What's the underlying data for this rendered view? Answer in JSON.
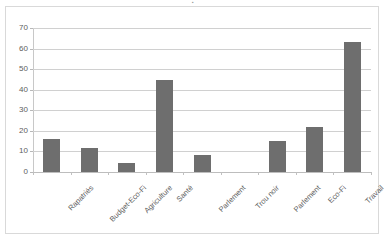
{
  "chart_data": {
    "type": "bar",
    "title": "",
    "subtitle": "",
    "xlabel": "",
    "ylabel": "",
    "categories": [
      "Rapatriés",
      "Budget-Eco-Fi",
      "Agriculture",
      "Santé",
      "Parlement",
      "Trou noir",
      "Parlement",
      "Eco-Fi",
      "Travail"
    ],
    "values": [
      16,
      11.5,
      4.5,
      44.5,
      8.5,
      0,
      15.3,
      22,
      63
    ],
    "ylim": [
      0,
      70
    ],
    "ytick_values": [
      0,
      10,
      20,
      30,
      40,
      50,
      60,
      70
    ],
    "ytick_labels": [
      "0",
      "10",
      "20",
      "30",
      "40",
      "50",
      "60",
      "70"
    ],
    "grid": true,
    "legend": false,
    "legend_position": "none",
    "series": [
      {
        "name": "",
        "values": [
          16,
          11.5,
          4.5,
          44.5,
          8.5,
          0,
          15.3,
          22,
          63
        ],
        "color": "#6E6E6E"
      }
    ]
  },
  "style": {
    "bar_color": "#6E6E6E",
    "gridline_color": "#D0D0D0",
    "axis_color": "#C8C8C8",
    "tick_label_color": "#5D5D5D",
    "background": "#FFFFFF",
    "frame_border": "#D9D9D9"
  },
  "artifacts": {
    "title_remnant": "▪"
  }
}
